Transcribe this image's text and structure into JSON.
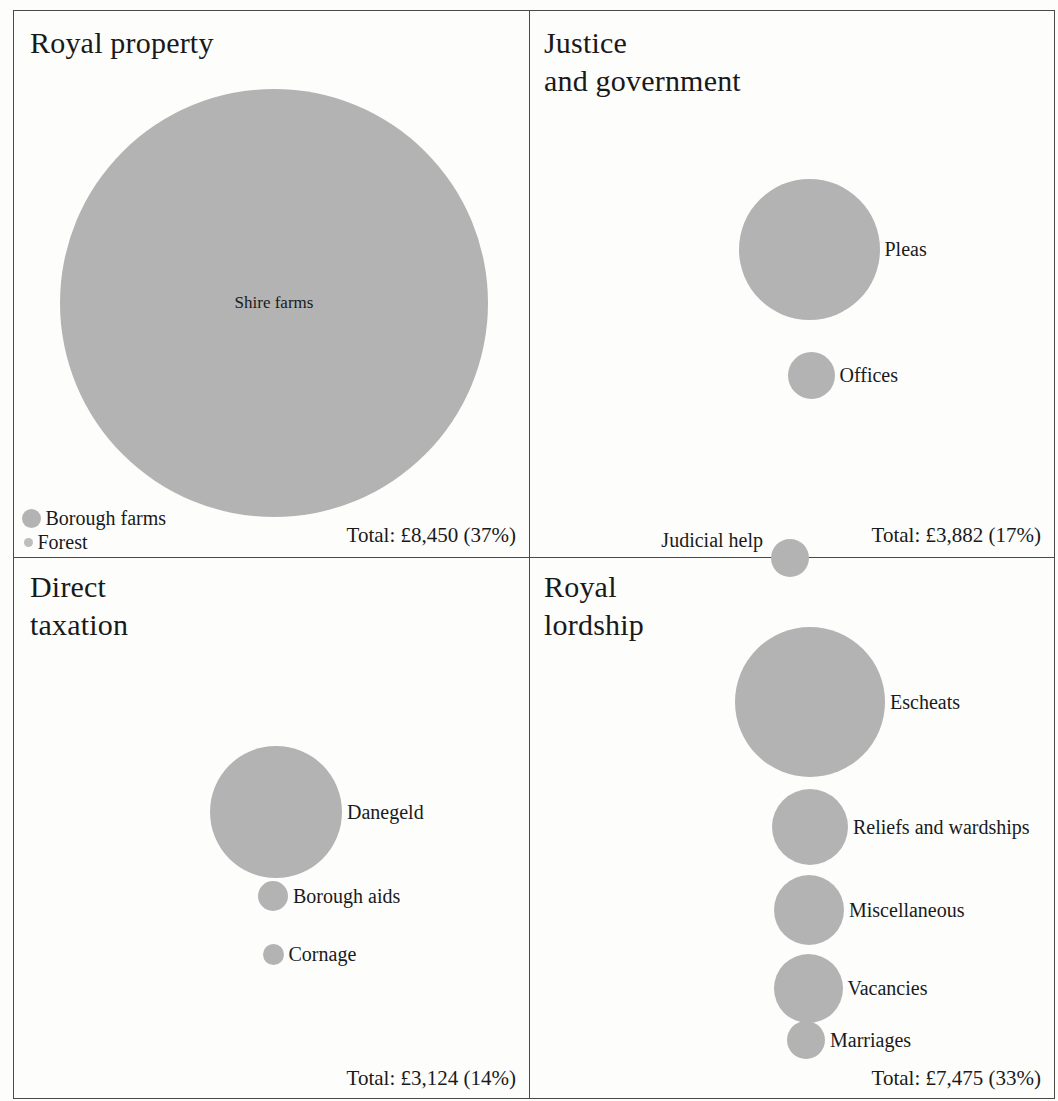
{
  "chart_data": {
    "type": "bubble",
    "units": "£",
    "legend_position": "none",
    "grid": false,
    "panels": [
      {
        "id": "royal-property",
        "title": "Royal property",
        "total_label": "Total: £8,450  (37%)",
        "total_value": 8450,
        "total_percent": 37,
        "items": [
          {
            "label": "Shire farms",
            "value": 8000,
            "diameter": 428,
            "cx": 274,
            "cy": 303,
            "label_pos": "center"
          },
          {
            "label": "Borough farms",
            "value": 380,
            "diameter": 19,
            "cx": 31,
            "cy": 518,
            "label_pos": "right"
          },
          {
            "label": "Forest",
            "value": 70,
            "diameter": 9,
            "cx": 28,
            "cy": 542,
            "label_pos": "right"
          }
        ]
      },
      {
        "id": "justice-and-government",
        "title": "Justice\nand government",
        "total_label": "Total: £3,882  (17%)",
        "total_value": 3882,
        "total_percent": 17,
        "items": [
          {
            "label": "Pleas",
            "value": 2600,
            "diameter": 141,
            "cx": 809,
            "cy": 249,
            "label_pos": "right"
          },
          {
            "label": "Offices",
            "value": 880,
            "diameter": 47,
            "cx": 811,
            "cy": 375,
            "label_pos": "right"
          },
          {
            "label": "Judicial help",
            "value": 400,
            "diameter": 38,
            "cx": 790,
            "cy": 558,
            "label_pos": "left"
          }
        ]
      },
      {
        "id": "direct-taxation",
        "title": "Direct\ntaxation",
        "total_label": "Total: £3,124  (14%)",
        "total_value": 3124,
        "total_percent": 14,
        "items": [
          {
            "label": "Danegeld",
            "value": 2400,
            "diameter": 132,
            "cx": 276,
            "cy": 812,
            "label_pos": "right"
          },
          {
            "label": "Borough aids",
            "value": 540,
            "diameter": 30,
            "cx": 273,
            "cy": 896,
            "label_pos": "right"
          },
          {
            "label": "Cornage",
            "value": 190,
            "diameter": 21,
            "cx": 273,
            "cy": 954,
            "label_pos": "right"
          }
        ]
      },
      {
        "id": "royal-lordship",
        "title": "Royal\nlordship",
        "total_label": "Total: £7,475  (33%)",
        "total_value": 7475,
        "total_percent": 33,
        "items": [
          {
            "label": "Escheats",
            "value": 3100,
            "diameter": 150,
            "cx": 810,
            "cy": 702,
            "label_pos": "right"
          },
          {
            "label": "Reliefs and wardships",
            "value": 1500,
            "diameter": 76,
            "cx": 810,
            "cy": 827,
            "label_pos": "right"
          },
          {
            "label": "Miscellaneous",
            "value": 1300,
            "diameter": 70,
            "cx": 809,
            "cy": 910,
            "label_pos": "right"
          },
          {
            "label": "Vacancies",
            "value": 1200,
            "diameter": 69,
            "cx": 808,
            "cy": 988,
            "label_pos": "right"
          },
          {
            "label": "Marriages",
            "value": 400,
            "diameter": 38,
            "cx": 806,
            "cy": 1040,
            "label_pos": "right"
          }
        ]
      }
    ],
    "colors": {
      "bubble_fill": "#b3b3b3",
      "text": "#1a1a1a",
      "rule": "#4a4a4a",
      "background": "#fdfdfc"
    }
  }
}
